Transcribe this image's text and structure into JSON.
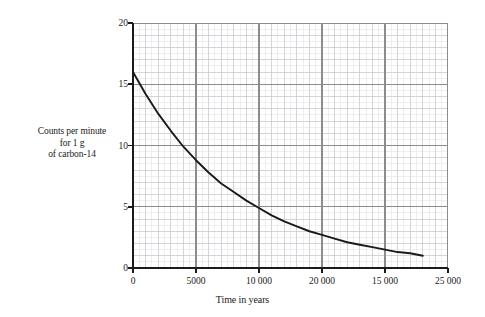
{
  "chart_data": {
    "type": "line",
    "title": "",
    "subtitle": "",
    "xlabel": "Time in years",
    "ylabel": "Counts per minute for 1 g of carbon-14",
    "ylabel_lines": [
      "Counts per minute",
      "for 1 g",
      "of carbon-14"
    ],
    "xlim": [
      0,
      25000
    ],
    "ylim": [
      0,
      20
    ],
    "grid": true,
    "grid_style": "graph-paper (fine minor grid, 2 mm medium, 1 cm major)",
    "legend": "none",
    "legend_position": "none",
    "x_tick_values": [
      0,
      5000,
      10000,
      20000,
      15000,
      25000
    ],
    "x_tick_labels": [
      "0",
      "5000",
      "10 000",
      "20 000",
      "15 000",
      "25 000"
    ],
    "y_tick_values": [
      0,
      5,
      10,
      15,
      20
    ],
    "y_tick_labels": [
      "0",
      "5",
      "10",
      "15",
      "20"
    ],
    "series": [
      {
        "name": "carbon-14 decay",
        "color": "#1a1a1a",
        "x": [
          0,
          1000,
          2000,
          3000,
          4000,
          5000,
          6000,
          7000,
          8000,
          9000,
          10000,
          11000,
          12000,
          13000,
          14000,
          15000,
          16000,
          17000,
          18000,
          19000,
          20000,
          21000,
          22000,
          23000
        ],
        "y": [
          16.0,
          14.2,
          12.6,
          11.2,
          9.9,
          8.8,
          7.8,
          6.9,
          6.2,
          5.5,
          4.9,
          4.3,
          3.8,
          3.4,
          3.0,
          2.7,
          2.4,
          2.1,
          1.9,
          1.7,
          1.5,
          1.3,
          1.2,
          1.0
        ]
      }
    ],
    "annotations": []
  },
  "axes": {
    "x_title": "Time in years",
    "y_title_lines": [
      "Counts per minute",
      "for 1 g",
      "of carbon-14"
    ]
  },
  "colors": {
    "curve": "#1a1a1a",
    "axis": "#1a1a1a",
    "grid_major": "#8c8c8c",
    "grid_medium": "#c9c9cf",
    "grid_minor": "#e4e4ea",
    "background": "#ffffff"
  }
}
